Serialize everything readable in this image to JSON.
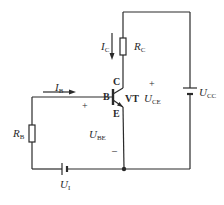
{
  "diagram": {
    "type": "circuit-schematic",
    "components": {
      "transistor": {
        "name": "VT",
        "terminals": {
          "base": "B",
          "collector": "C",
          "emitter": "E"
        }
      },
      "collector_resistor": {
        "label": "R",
        "sub": "C"
      },
      "base_resistor": {
        "label": "R",
        "sub": "B"
      },
      "collector_supply": {
        "label": "U",
        "sub": "CC"
      },
      "input_source": {
        "label": "U",
        "sub": "I"
      }
    },
    "currents": {
      "base_current": {
        "label": "I",
        "sub": "B",
        "direction": "right"
      },
      "collector_current": {
        "label": "I",
        "sub": "C",
        "direction": "down"
      }
    },
    "voltages": {
      "ube": {
        "label": "U",
        "sub": "BE",
        "plus": "+",
        "minus": "–"
      },
      "uce": {
        "label": "U",
        "sub": "CE",
        "plus": "+"
      }
    }
  }
}
